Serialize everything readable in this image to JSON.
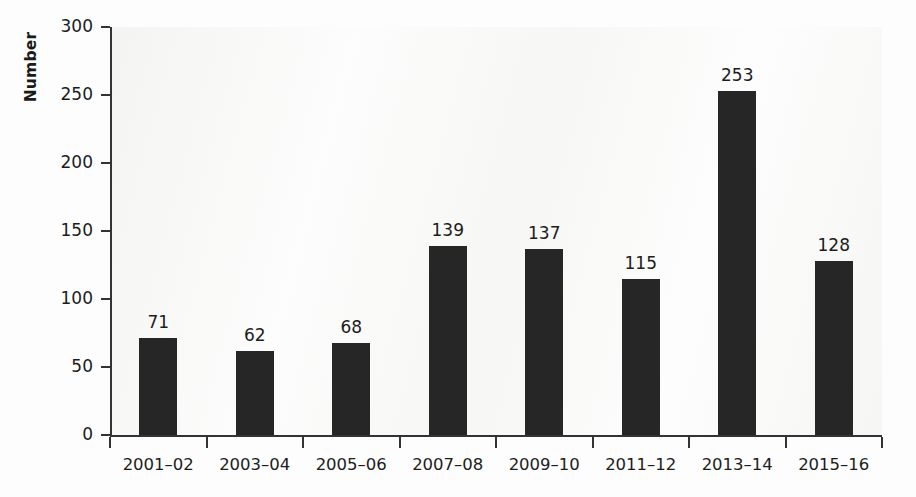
{
  "chart_data": {
    "type": "bar",
    "title": "",
    "subtitle": "",
    "xlabel": "",
    "ylabel": "Number",
    "categories": [
      "2001–02",
      "2003–04",
      "2005–06",
      "2007–08",
      "2009–10",
      "2011–12",
      "2013–14",
      "2015–16"
    ],
    "values": [
      71,
      62,
      68,
      139,
      137,
      115,
      253,
      128
    ],
    "value_labels": [
      "71",
      "62",
      "68",
      "139",
      "137",
      "115",
      "253",
      "128"
    ],
    "ylim": [
      0,
      300
    ],
    "ytick_values": [
      0,
      50,
      100,
      150,
      200,
      250,
      300
    ],
    "ytick_labels": [
      "0",
      "50",
      "100",
      "150",
      "200",
      "250",
      "300"
    ],
    "grid": false,
    "legend": false,
    "legend_position": "none",
    "bar_color": "#262626",
    "axis_color": "#333333",
    "background_color": "#fdfdfd",
    "data_labels_shown": true,
    "tick_direction": "out",
    "xtick_placement": "between-categories"
  }
}
